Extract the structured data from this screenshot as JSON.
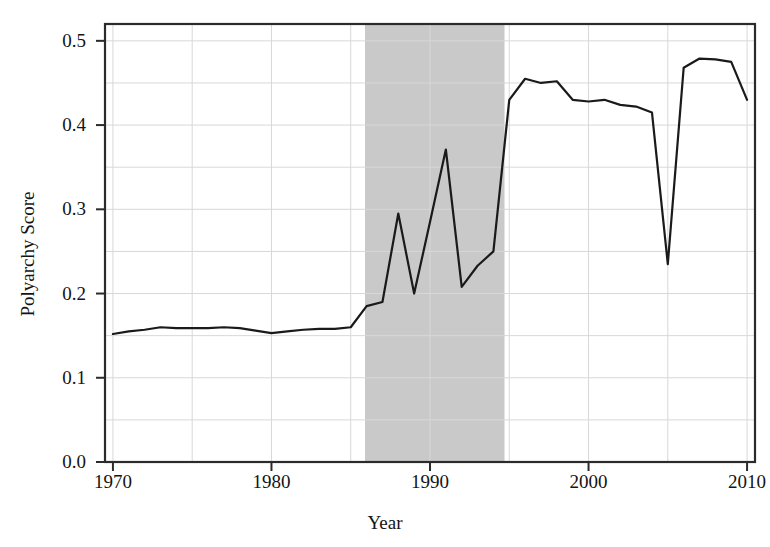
{
  "chart_data": {
    "type": "line",
    "title": "",
    "xlabel": "Year",
    "ylabel": "Polyarchy Score",
    "xlim": [
      1969.5,
      2010.5
    ],
    "ylim": [
      0.0,
      0.52
    ],
    "grid": true,
    "legend": null,
    "x": [
      1970,
      1971,
      1972,
      1973,
      1974,
      1975,
      1976,
      1977,
      1978,
      1979,
      1980,
      1981,
      1982,
      1983,
      1984,
      1985,
      1986,
      1987,
      1988,
      1989,
      1990,
      1991,
      1992,
      1993,
      1994,
      1995,
      1996,
      1997,
      1998,
      1999,
      2000,
      2001,
      2002,
      2003,
      2004,
      2005,
      2006,
      2007,
      2008,
      2009,
      2010
    ],
    "values": [
      0.152,
      0.155,
      0.157,
      0.16,
      0.159,
      0.159,
      0.159,
      0.16,
      0.159,
      0.156,
      0.153,
      0.155,
      0.157,
      0.158,
      0.158,
      0.16,
      0.185,
      0.19,
      0.295,
      0.2,
      0.285,
      0.371,
      0.208,
      0.233,
      0.25,
      0.43,
      0.455,
      0.45,
      0.452,
      0.43,
      0.428,
      0.43,
      0.424,
      0.422,
      0.415,
      0.235,
      0.468,
      0.479,
      0.478,
      0.475,
      0.43
    ],
    "series_name": "Polyarchy Score",
    "line_color": "#1a1a1a",
    "line_width": 2.2,
    "xticks": [
      1970,
      1980,
      1990,
      2000,
      2010
    ],
    "xtick_labels": [
      "1970",
      "1980",
      "1990",
      "2000",
      "2010"
    ],
    "yticks": [
      0.0,
      0.1,
      0.2,
      0.3,
      0.4,
      0.5
    ],
    "ytick_labels": [
      "0.0",
      "0.1",
      "0.2",
      "0.3",
      "0.4",
      "0.5"
    ],
    "y_minor_ticks": [
      0.05,
      0.15,
      0.25,
      0.35,
      0.45
    ],
    "x_minor_ticks": [
      1975,
      1985,
      1995,
      2005
    ],
    "shaded_region": {
      "x_start": 1985.9,
      "x_end": 1994.7,
      "color": "#c9c9c9",
      "label": ""
    },
    "grid_color": "#d8d8d8",
    "frame_color": "#2b2b2b",
    "background_color": "#ffffff"
  }
}
